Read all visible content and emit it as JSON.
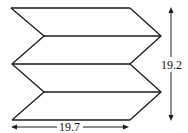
{
  "diagram": {
    "shape": "zigzag-folded-parallelogram-stack",
    "stroke_color": "#1a1a1a",
    "background": "#ffffff",
    "height_label": "19.2",
    "width_label": "19.7",
    "height_arrow_icon": "double-arrow-vertical-icon",
    "width_arrow_icon": "double-arrow-horizontal-icon"
  }
}
